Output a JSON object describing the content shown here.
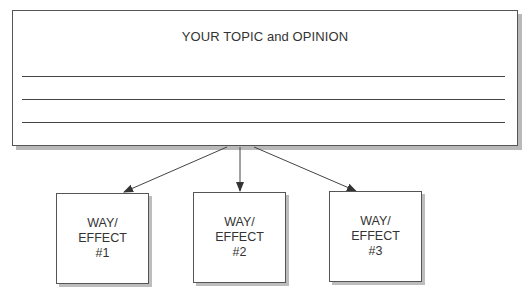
{
  "topic": {
    "title": "YOUR TOPIC and OPINION",
    "line_count": 3
  },
  "effects": [
    {
      "line1": "WAY/",
      "line2": "EFFECT",
      "line3": "#1"
    },
    {
      "line1": "WAY/",
      "line2": "EFFECT",
      "line3": "#2"
    },
    {
      "line1": "WAY/",
      "line2": "EFFECT",
      "line3": "#3"
    }
  ],
  "colors": {
    "border": "#555555",
    "shadow": "#b9b9b9",
    "text": "#333333"
  }
}
